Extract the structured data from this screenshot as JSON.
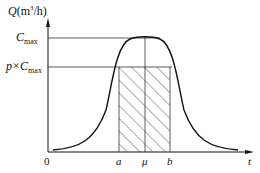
{
  "axes": {
    "y_label": "Q(m³/h)",
    "x_label": "t",
    "origin": "0"
  },
  "levels": {
    "cmax": "C",
    "cmax_sub": "max",
    "pcmax_prefix": "p×C",
    "pcmax_sub": "max"
  },
  "x_ticks": {
    "a": "a",
    "mu": "μ",
    "b": "b"
  },
  "colors": {
    "line": "#111111",
    "hatch": "#333333"
  }
}
